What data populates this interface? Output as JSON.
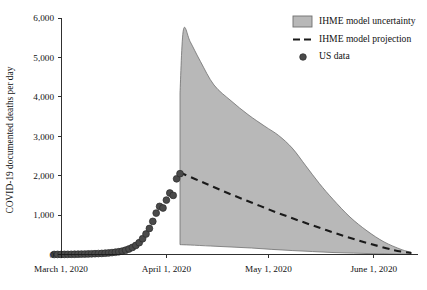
{
  "chart_data": {
    "type": "area",
    "title": "",
    "xlabel": "",
    "ylabel": "COVID-19 documented deaths per day",
    "ylim": [
      0,
      6000
    ],
    "xlim_days": [
      0,
      105
    ],
    "grid": false,
    "legend_position": "top-right",
    "ytick_labels": [
      "0",
      "1,000",
      "2,000",
      "3,000",
      "4,000",
      "5,000",
      "6,000"
    ],
    "ytick_values": [
      0,
      1000,
      2000,
      3000,
      4000,
      5000,
      6000
    ],
    "xtick_labels": [
      "March 1, 2020",
      "April 1, 2020",
      "May 1, 2020",
      "June 1, 2020"
    ],
    "xtick_days": [
      0,
      31,
      61,
      92
    ],
    "legend": [
      {
        "label": "IHME model uncertainty",
        "marker": "filled-box",
        "color": "#b8b8b8"
      },
      {
        "label": "IHME model projection",
        "marker": "dashed-line",
        "color": "#1a1a1a"
      },
      {
        "label": "US data",
        "marker": "circle",
        "color": "#4a4a4a"
      }
    ],
    "series": [
      {
        "name": "US data",
        "type": "scatter",
        "x_days": [
          -2,
          -1,
          0,
          1,
          2,
          3,
          4,
          5,
          6,
          7,
          8,
          9,
          10,
          11,
          12,
          13,
          14,
          15,
          16,
          17,
          18,
          19,
          20,
          21,
          22,
          23,
          24,
          25,
          26,
          27,
          28,
          29,
          30,
          31,
          32,
          33,
          34,
          35
        ],
        "values": [
          1,
          2,
          2,
          3,
          4,
          5,
          6,
          8,
          10,
          12,
          14,
          17,
          20,
          24,
          28,
          34,
          40,
          48,
          58,
          70,
          86,
          110,
          140,
          180,
          230,
          300,
          400,
          520,
          660,
          840,
          1050,
          1220,
          1180,
          1380,
          1560,
          1500,
          1920,
          2050
        ]
      },
      {
        "name": "IHME model projection",
        "type": "line",
        "x_days": [
          35,
          42,
          49,
          56,
          63,
          70,
          77,
          84,
          91,
          98,
          103
        ],
        "values": [
          2080,
          1820,
          1560,
          1320,
          1080,
          860,
          650,
          450,
          270,
          110,
          40
        ]
      },
      {
        "name": "IHME model uncertainty upper",
        "type": "band-upper",
        "x_days": [
          35,
          36,
          38,
          41,
          45,
          50,
          55,
          60,
          64,
          68,
          72,
          76,
          80,
          85,
          90,
          95,
          100,
          103
        ],
        "values": [
          4100,
          5700,
          5400,
          4900,
          4300,
          3900,
          3550,
          3250,
          3020,
          2700,
          2250,
          1800,
          1400,
          950,
          600,
          320,
          130,
          55
        ]
      },
      {
        "name": "IHME model uncertainty lower",
        "type": "band-lower",
        "x_days": [
          35,
          38,
          44,
          50,
          56,
          62,
          68,
          74,
          80,
          86,
          92,
          98,
          103
        ],
        "values": [
          250,
          240,
          215,
          190,
          165,
          130,
          100,
          75,
          50,
          35,
          20,
          10,
          5
        ]
      }
    ]
  }
}
